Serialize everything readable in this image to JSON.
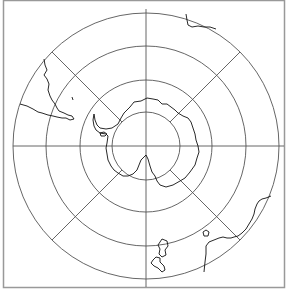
{
  "map": {
    "projection": "south-polar-stereographic",
    "frame": {
      "x": 3,
      "y": 0,
      "width": 282,
      "height": 288
    },
    "center": {
      "x": 146,
      "y": 146
    },
    "graticule": {
      "ring_radii": [
        34,
        66,
        100,
        133
      ],
      "meridian_angles_deg": [
        45,
        135,
        225,
        315
      ]
    },
    "colors": {
      "frame": "#999999",
      "graticule": "#555555",
      "coastline": "#111111",
      "background": "#ffffff"
    },
    "features": [
      {
        "name": "antarctica"
      },
      {
        "name": "south-america"
      },
      {
        "name": "africa"
      },
      {
        "name": "australia"
      },
      {
        "name": "new-zealand"
      }
    ]
  }
}
